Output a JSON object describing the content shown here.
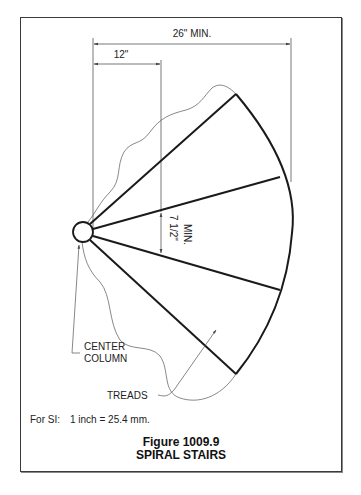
{
  "figure": {
    "number": "Figure 1009.9",
    "title": "SPIRAL STAIRS"
  },
  "dimensions": {
    "overall_width": "26\" MIN.",
    "column_offset": "12\"",
    "tread_width_line1": "7 1/2\"",
    "tread_width_line2": "MIN."
  },
  "labels": {
    "center_column_line1": "CENTER",
    "center_column_line2": "COLUMN",
    "treads": "TREADS"
  },
  "note": {
    "key": "For SI:",
    "value": "1 inch = 25.4 mm."
  }
}
